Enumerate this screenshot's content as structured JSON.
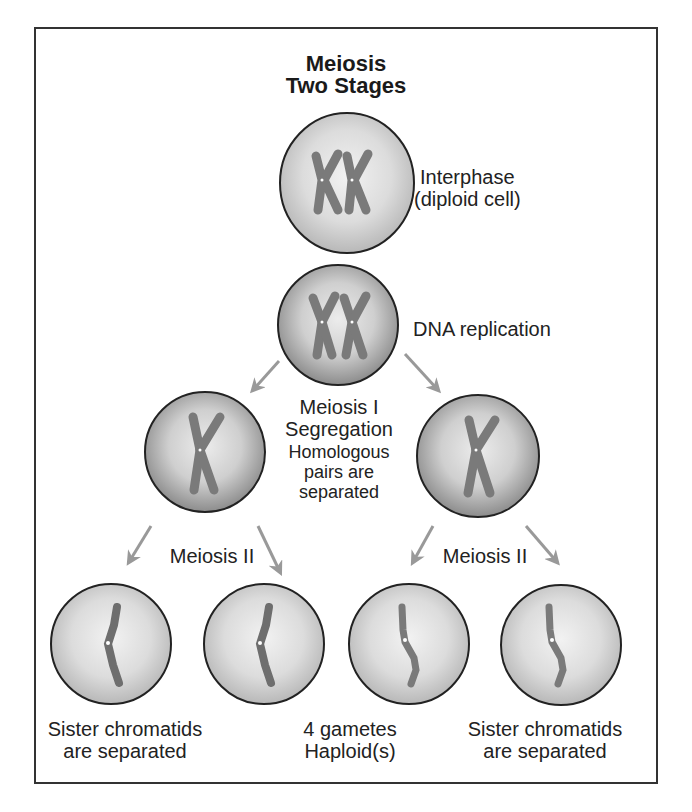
{
  "title": {
    "line1": "Meiosis",
    "line2": "Two Stages"
  },
  "colors": {
    "frame": "#333333",
    "cell_rim": "#222222",
    "cell_fill_center": "#eeeeee",
    "cell_fill_edge": "#bdbdbd",
    "cell_fill_edge_dark": "#8f8f8f",
    "chromosome": "#7a7a7a",
    "arrow": "#999999",
    "text": "#222222"
  },
  "stages": {
    "interphase": {
      "label_line1": "Interphase",
      "label_line2": "(diploid cell)",
      "chromosome_icon": "two-chromosomes-icon"
    },
    "replication": {
      "label": "DNA replication",
      "chromosome_icon": "replicated-chromosomes-icon"
    },
    "meiosis1": {
      "label_line1": "Meiosis I",
      "label_line2": "Segregation",
      "note_line1": "Homologous",
      "note_line2": "pairs are",
      "note_line3": "separated"
    },
    "meiosis2_left": {
      "label": "Meiosis II"
    },
    "meiosis2_right": {
      "label": "Meiosis II"
    },
    "bottom_left": {
      "line1": "Sister chromatids",
      "line2": "are separated"
    },
    "bottom_center": {
      "line1": "4 gametes",
      "line2": "Haploid(s)"
    },
    "bottom_right": {
      "line1": "Sister chromatids",
      "line2": "are separated"
    }
  },
  "cells": [
    {
      "id": "interphase-cell",
      "cx": 347,
      "cy": 183,
      "r": 69,
      "type": "diploid"
    },
    {
      "id": "replication-cell",
      "cx": 338,
      "cy": 325,
      "r": 60,
      "type": "replicated"
    },
    {
      "id": "meiosis1-left-cell",
      "cx": 205,
      "cy": 452,
      "r": 60,
      "type": "single-x"
    },
    {
      "id": "meiosis1-right-cell",
      "cx": 478,
      "cy": 456,
      "r": 61,
      "type": "single-x"
    },
    {
      "id": "gamete-cell-1",
      "cx": 111,
      "cy": 644,
      "r": 60,
      "type": "chromatid"
    },
    {
      "id": "gamete-cell-2",
      "cx": 264,
      "cy": 644,
      "r": 60,
      "type": "chromatid"
    },
    {
      "id": "gamete-cell-3",
      "cx": 409,
      "cy": 644,
      "r": 60,
      "type": "chromatid-s"
    },
    {
      "id": "gamete-cell-4",
      "cx": 561,
      "cy": 645,
      "r": 60,
      "type": "chromatid-s"
    }
  ]
}
